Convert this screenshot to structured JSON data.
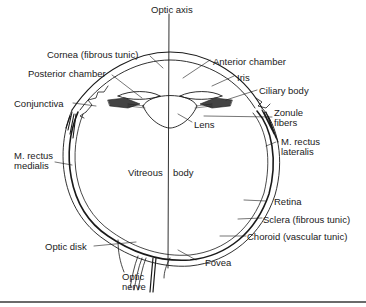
{
  "diagram": {
    "labels": {
      "optic_axis": "Optic axis",
      "cornea": "Cornea (fibrous tunic)",
      "anterior_chamber": "Anterior chamber",
      "posterior_chamber": "Posterior chamber",
      "iris": "Iris",
      "ciliary_body": "Ciliary body",
      "conjunctiva": "Conjunctiva",
      "zonule_fibers_1": "Zonule",
      "zonule_fibers_2": "fibers",
      "lens": "Lens",
      "m_rectus_lateralis_1": "M. rectus",
      "m_rectus_lateralis_2": "lateralis",
      "m_rectus_medialis_1": "M. rectus",
      "m_rectus_medialis_2": "medialis",
      "vitreous": "Vitreous",
      "body": "body",
      "retina": "Retina",
      "sclera": "Sclera (fibrous tunic)",
      "choroid": "Choroid (vascular tunic)",
      "optic_disk": "Optic disk",
      "optic_nerve_1": "Optic",
      "optic_nerve_2": "nerve",
      "fovea": "Fovea"
    },
    "colors": {
      "ink": "#1a1a1a",
      "background": "#ffffff",
      "rule": "#6a6a6a"
    }
  }
}
